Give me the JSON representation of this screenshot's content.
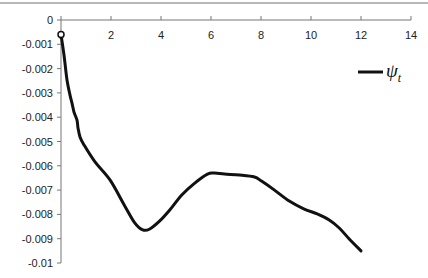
{
  "chart_data": {
    "type": "line",
    "title": "",
    "xlabel": "",
    "ylabel": "",
    "xlim": [
      0,
      14
    ],
    "ylim": [
      -0.01,
      0
    ],
    "x_ticks": [
      0,
      2,
      4,
      6,
      8,
      10,
      12,
      14
    ],
    "x_tick_labels": [
      "0",
      "2",
      "4",
      "6",
      "8",
      "10",
      "12",
      "14"
    ],
    "y_ticks": [
      0,
      -0.001,
      -0.002,
      -0.003,
      -0.004,
      -0.005,
      -0.006,
      -0.007,
      -0.008,
      -0.009,
      -0.01
    ],
    "y_tick_labels": [
      "0",
      "-0.001",
      "-0.002",
      "-0.003",
      "-0.004",
      "-0.005",
      "-0.006",
      "-0.007",
      "-0.008",
      "-0.009",
      "-0.01"
    ],
    "x_axis_position": "top",
    "grid": false,
    "legend_position": "right",
    "series": [
      {
        "name": "ψ",
        "name_subscript": "t",
        "color": "#111111",
        "x": [
          0,
          0.12,
          0.24,
          0.36,
          0.44,
          0.52,
          0.64,
          0.68,
          0.76,
          0.92,
          1.36,
          1.96,
          2.55,
          2.95,
          3.27,
          3.55,
          3.95,
          4.35,
          4.83,
          5.35,
          5.86,
          6.14,
          6.54,
          7.14,
          7.74,
          8.02,
          8.54,
          9.13,
          9.73,
          10.25,
          10.73,
          11.13,
          11.53,
          12.0
        ],
        "y": [
          -0.0006,
          -0.00144,
          -0.00247,
          -0.00309,
          -0.00342,
          -0.00379,
          -0.00412,
          -0.00444,
          -0.00481,
          -0.00514,
          -0.00584,
          -0.00658,
          -0.00765,
          -0.00835,
          -0.00864,
          -0.0086,
          -0.00827,
          -0.00782,
          -0.0072,
          -0.00671,
          -0.00634,
          -0.0063,
          -0.00634,
          -0.00638,
          -0.00646,
          -0.00663,
          -0.007,
          -0.00745,
          -0.00778,
          -0.00798,
          -0.00823,
          -0.00856,
          -0.00901,
          -0.0095
        ]
      }
    ]
  }
}
